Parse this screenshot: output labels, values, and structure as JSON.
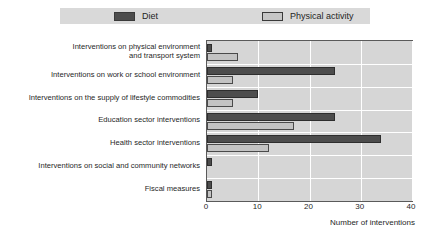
{
  "legend": {
    "entries": [
      {
        "label": "Diet",
        "color": "#4d4d4d",
        "icon": "legend-swatch-icon"
      },
      {
        "label": "Physical activity",
        "color": "#c3c3c3",
        "icon": "legend-swatch-icon"
      }
    ]
  },
  "axis": {
    "x_title": "Number of interventions",
    "ticks": [
      "0",
      "10",
      "20",
      "30",
      "40"
    ]
  },
  "chart_data": {
    "type": "bar",
    "orientation": "horizontal",
    "title": "",
    "xlabel": "Number of interventions",
    "ylabel": "",
    "xlim": [
      0,
      40
    ],
    "xticks": [
      0,
      10,
      20,
      30,
      40
    ],
    "grid": true,
    "legend_position": "top",
    "categories": [
      "Interventions on physical environment\nand transport system",
      "Interventions on work or school environment",
      "Interventions on the supply of lifestyle commodities",
      "Education sector interventions",
      "Health sector interventions",
      "Interventions on social and community networks",
      "Fiscal measures"
    ],
    "series": [
      {
        "name": "Diet",
        "color": "#4d4d4d",
        "values": [
          1,
          25,
          10,
          25,
          34,
          1,
          1
        ]
      },
      {
        "name": "Physical activity",
        "color": "#c3c3c3",
        "values": [
          6,
          5,
          5,
          17,
          12,
          0,
          1
        ]
      }
    ]
  }
}
